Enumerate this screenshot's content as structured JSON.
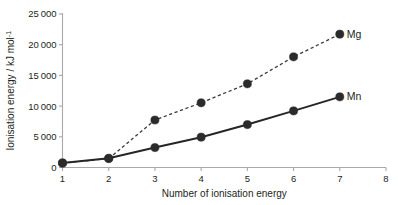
{
  "chart_data": {
    "type": "line",
    "title": "",
    "xlabel": "Number of ionisation energy",
    "ylabel": "Ionisation energy / kJ mol",
    "ylabel_superscript": "-1",
    "x": [
      1,
      2,
      3,
      4,
      5,
      6,
      7
    ],
    "xlim": [
      1,
      8
    ],
    "ylim": [
      0,
      25000
    ],
    "xticks": [
      "1",
      "2",
      "3",
      "4",
      "5",
      "6",
      "7",
      "8"
    ],
    "xtick_values": [
      1,
      2,
      3,
      4,
      5,
      6,
      7,
      8
    ],
    "yticks": [
      "0",
      "5000",
      "10000",
      "15000",
      "20000",
      "25000"
    ],
    "ytick_values": [
      0,
      5000,
      10000,
      15000,
      20000,
      25000
    ],
    "grid": false,
    "legend_position": "right-of-last-point",
    "series": [
      {
        "name": "Mg",
        "style": "dashed",
        "marker": "filled-circle",
        "values": [
          738,
          1450,
          7733,
          10540,
          13630,
          18020,
          21711
        ]
      },
      {
        "name": "Mn",
        "style": "solid",
        "marker": "filled-circle",
        "values": [
          717,
          1509,
          3248,
          4940,
          6990,
          9220,
          11508
        ]
      }
    ]
  },
  "colors": {
    "axis": "#a9a9a9",
    "text": "#231f20",
    "mg_line": "#3a3a3a",
    "mn_line": "#262626",
    "marker": "#2b2b2b",
    "background": "#ffffff"
  }
}
